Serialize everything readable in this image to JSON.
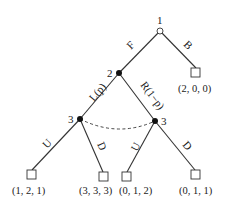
{
  "tree": {
    "nodes": {
      "root": {
        "player": "1",
        "x": 160,
        "y": 31,
        "style": "open"
      },
      "n2": {
        "player": "2",
        "x": 119,
        "y": 73,
        "style": "filled"
      },
      "n3L": {
        "player": "3",
        "x": 80,
        "y": 119,
        "style": "filled"
      },
      "n3R": {
        "player": "3",
        "x": 155,
        "y": 121,
        "style": "filled"
      }
    },
    "actions": {
      "F": "F",
      "B": "B",
      "L": "L(p)",
      "R": "R(1−p)",
      "U1": "U",
      "D1": "D",
      "U2": "U",
      "D2": "D"
    },
    "payoffs": {
      "B": "(2, 0, 0)",
      "LU": "(1, 2, 1)",
      "LD": "(3, 3, 3)",
      "RU": "(0, 1, 2)",
      "RD": "(0, 1, 1)"
    }
  }
}
